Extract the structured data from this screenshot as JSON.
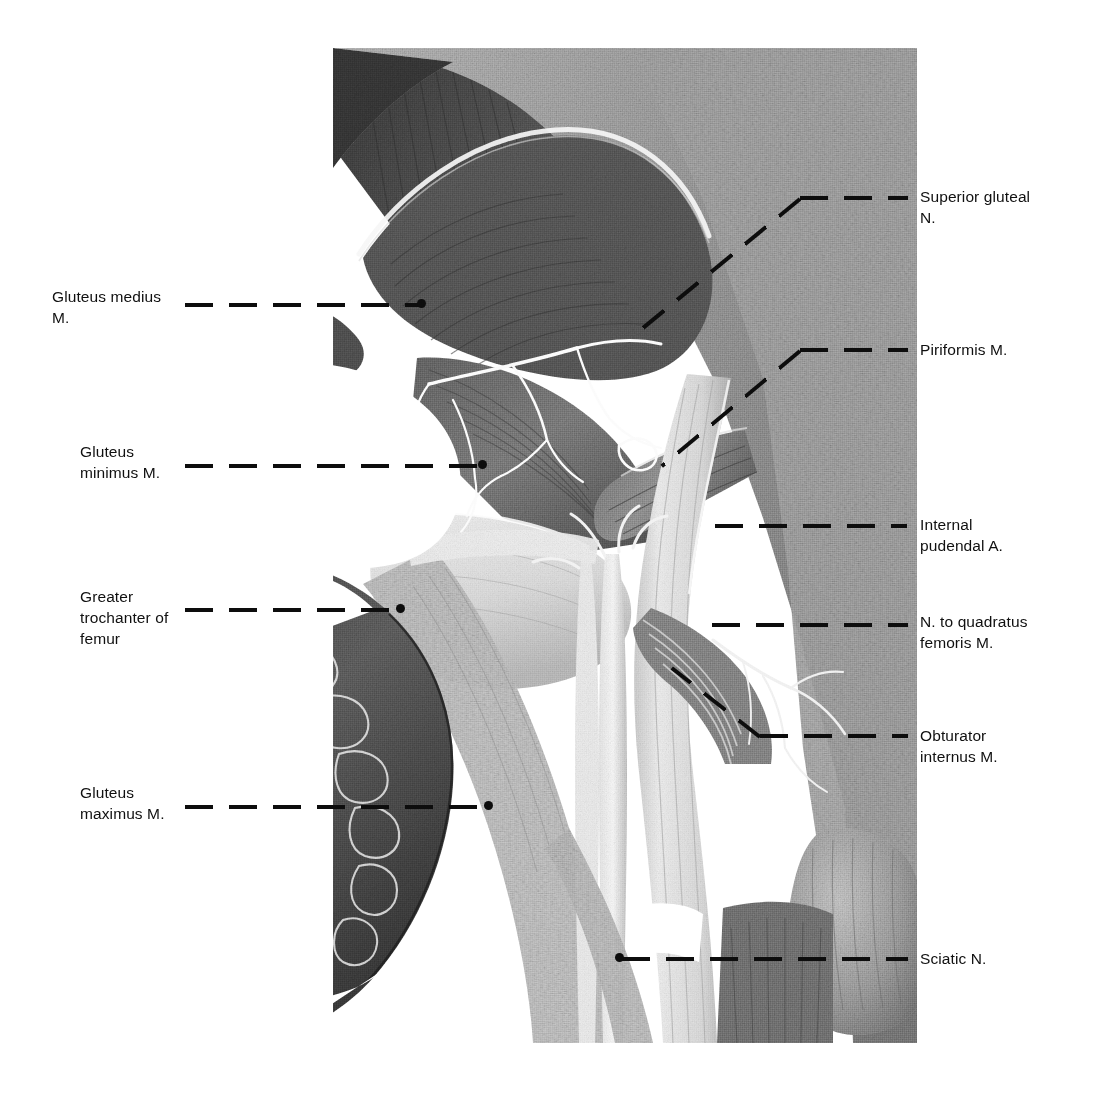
{
  "figure": {
    "type": "anatomical-photograph",
    "region": "Gluteal region, deep dissection (right side), posterior view",
    "plate": {
      "x": 333,
      "y": 48,
      "width": 584,
      "height": 995,
      "background_color": "#ffffff",
      "tone": "grayscale halftone photograph"
    },
    "leader_line_style": {
      "color": "#0d0d0d",
      "dash_length_px": 28,
      "gap_length_px": 16,
      "thickness_px": 4,
      "endpoint_marker": "filled dot"
    }
  },
  "labels": {
    "left": [
      {
        "id": "gluteus-medius",
        "text": "Gluteus medius\nM.",
        "x": 52,
        "y": 286,
        "leader": {
          "x": 185,
          "y": 303,
          "width": 236,
          "dot_x": 421,
          "dot_y": 299
        }
      },
      {
        "id": "gluteus-minimus",
        "text": "Gluteus\nminimus M.",
        "x": 80,
        "y": 441,
        "leader": {
          "x": 185,
          "y": 464,
          "width": 300,
          "dot_x": 482,
          "dot_y": 463
        }
      },
      {
        "id": "greater-trochanter",
        "text": "Greater\ntrochanter of\nfemur",
        "x": 80,
        "y": 586,
        "leader": {
          "x": 185,
          "y": 608,
          "width": 218,
          "dot_x": 400,
          "dot_y": 607
        }
      },
      {
        "id": "gluteus-maximus",
        "text": "Gluteus\nmaximus M.",
        "x": 80,
        "y": 782,
        "leader": {
          "x": 185,
          "y": 805,
          "width": 305,
          "dot_x": 488,
          "dot_y": 804
        }
      }
    ],
    "right": [
      {
        "id": "superior-gluteal-nerve",
        "text": "Superior gluteal\nN.",
        "x": 920,
        "y": 186,
        "leader": {
          "type": "diagonal",
          "x1": 903,
          "y1": 198,
          "x2": 742,
          "y2": 198,
          "x3": 617,
          "y3": 353
        }
      },
      {
        "id": "piriformis",
        "text": "Piriformis M.",
        "x": 920,
        "y": 339,
        "leader": {
          "type": "bent",
          "x1": 903,
          "y1": 350,
          "x2": 795,
          "y2": 350,
          "x3": 658,
          "y3": 466
        }
      },
      {
        "id": "internal-pudendal-artery",
        "text": "Internal\npudendal A.",
        "x": 920,
        "y": 514,
        "leader": {
          "type": "horizontal",
          "x": 715,
          "y": 526,
          "width": 192
        }
      },
      {
        "id": "nerve-to-quadratus-femoris",
        "text": "N. to quadratus\nfemoris M.",
        "x": 920,
        "y": 611,
        "leader": {
          "type": "horizontal",
          "x": 710,
          "y": 625,
          "width": 196
        }
      },
      {
        "id": "obturator-internus",
        "text": "Obturator\ninternus M.",
        "x": 920,
        "y": 725,
        "leader": {
          "type": "bent",
          "x1": 903,
          "y1": 736,
          "x2": 731,
          "y2": 736,
          "x3": 672,
          "y3": 659
        }
      },
      {
        "id": "sciatic-nerve",
        "text": "Sciatic N.",
        "x": 920,
        "y": 948,
        "leader": {
          "type": "horizontal",
          "x": 622,
          "y": 959,
          "width": 285,
          "dot_x": 618,
          "dot_y": 955
        }
      }
    ]
  },
  "structures": [
    {
      "name": "Gluteus medius M.",
      "note": "reflected flap, upper left"
    },
    {
      "name": "Gluteus minimus M.",
      "note": "deep fan-shaped muscle"
    },
    {
      "name": "Greater trochanter of femur",
      "note": "pale bony prominence, left-center"
    },
    {
      "name": "Gluteus maximus M.",
      "note": "reflected flap, lower left"
    },
    {
      "name": "Superior gluteal N.",
      "note": "upper right, entering deep to gluteus medius"
    },
    {
      "name": "Piriformis M.",
      "note": "oblique band crossing greater sciatic foramen"
    },
    {
      "name": "Internal pudendal A.",
      "note": "vessel below piriformis"
    },
    {
      "name": "N. to quadratus femoris M.",
      "note": "small nerve branch, right"
    },
    {
      "name": "Obturator internus M.",
      "note": "fan of fibers converging to lesser sciatic notch"
    },
    {
      "name": "Sciatic N.",
      "note": "broad pale trunk descending vertically"
    }
  ]
}
